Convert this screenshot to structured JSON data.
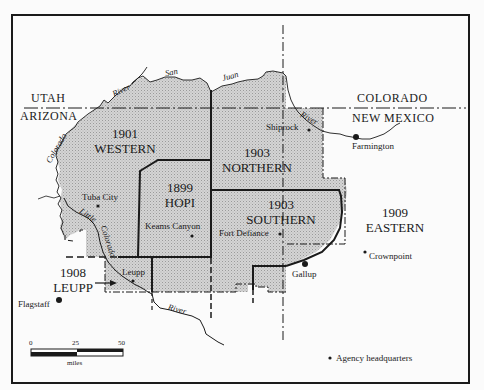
{
  "map": {
    "title_states": {
      "utah": "UTAH",
      "arizona": "ARIZONA",
      "colorado": "COLORADO",
      "new_mexico": "NEW MEXICO"
    },
    "regions": [
      {
        "year": "1901",
        "name": "WESTERN"
      },
      {
        "year": "1899",
        "name": "HOPI"
      },
      {
        "year": "1903",
        "name": "NORTHERN"
      },
      {
        "year": "1903",
        "name": "SOUTHERN"
      },
      {
        "year": "1909",
        "name": "EASTERN"
      },
      {
        "year": "1908",
        "name": "LEUPP"
      }
    ],
    "places": {
      "tuba_city": "Tuba City",
      "keams_canyon": "Keams Canyon",
      "shiprock": "Shiprock",
      "farmington": "Farmington",
      "fort_defiance": "Fort Defiance",
      "crownpoint": "Crownpoint",
      "gallup": "Gallup",
      "leupp": "Leupp",
      "flagstaff": "Flagstaff"
    },
    "rivers": {
      "san": "San",
      "juan": "Juan",
      "river_north": "River",
      "colorado": "Colorado",
      "little": "Little",
      "little_colorado": "Colorado",
      "river_shiprock": "River",
      "river_south": "River"
    },
    "scale": {
      "ticks": [
        "0",
        "25",
        "50"
      ],
      "unit": "miles"
    },
    "legend": {
      "agency_hq": "Agency headquarters"
    },
    "colors": {
      "shaded": "#c8c8c8",
      "line": "#1a1a1a",
      "background": "#fbfbfb"
    }
  }
}
